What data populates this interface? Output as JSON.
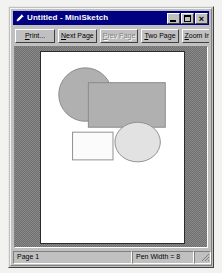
{
  "window": {
    "title": "Untitled - MiniSketch",
    "icon": "pencil-icon",
    "controls": {
      "minimize": "minimize-icon",
      "maximize": "maximize-icon",
      "close": "close-icon",
      "close_glyph": "×"
    }
  },
  "toolbar": {
    "buttons": [
      {
        "label": "Print...",
        "name": "print-button",
        "enabled": true,
        "accel": "P"
      },
      {
        "label": "Next Page",
        "name": "next-page-button",
        "enabled": true,
        "accel": "N"
      },
      {
        "label": "Prev Page",
        "name": "prev-page-button",
        "enabled": false,
        "accel": "P"
      },
      {
        "label": "Two Page",
        "name": "two-page-button",
        "enabled": true,
        "accel": "T"
      },
      {
        "label": "Zoom In",
        "name": "zoom-in-button",
        "enabled": true,
        "accel": "Z"
      }
    ]
  },
  "status_bar": {
    "page_label": "Page 1",
    "pen_width_label": "Pen Width = 8",
    "pen_swatch_color": "#c0c0c0"
  },
  "preview": {
    "background_color": "#808080",
    "page_background": "#ffffff",
    "page_border_color": "#2b2b2b"
  },
  "drawing": {
    "shapes": [
      {
        "name": "large-ellipse",
        "type": "ellipse",
        "cx": 45,
        "cy": 43,
        "rx": 27,
        "ry": 27,
        "fill": "#b0b0b0",
        "stroke": "#8a8a8a",
        "stroke_width": 1
      },
      {
        "name": "large-rectangle",
        "type": "rect",
        "x": 48,
        "y": 31,
        "width": 78,
        "height": 45,
        "fill": "#b0b0b0",
        "stroke": "#8a8a8a",
        "stroke_width": 1
      },
      {
        "name": "small-rectangle",
        "type": "rect",
        "x": 32,
        "y": 81,
        "width": 41,
        "height": 28,
        "fill": "#fbfbfb",
        "stroke": "#909090",
        "stroke_width": 1
      },
      {
        "name": "small-ellipse",
        "type": "ellipse",
        "cx": 98,
        "cy": 91,
        "rx": 23,
        "ry": 20,
        "fill": "#e2e2e2",
        "stroke": "#909090",
        "stroke_width": 1
      }
    ]
  }
}
